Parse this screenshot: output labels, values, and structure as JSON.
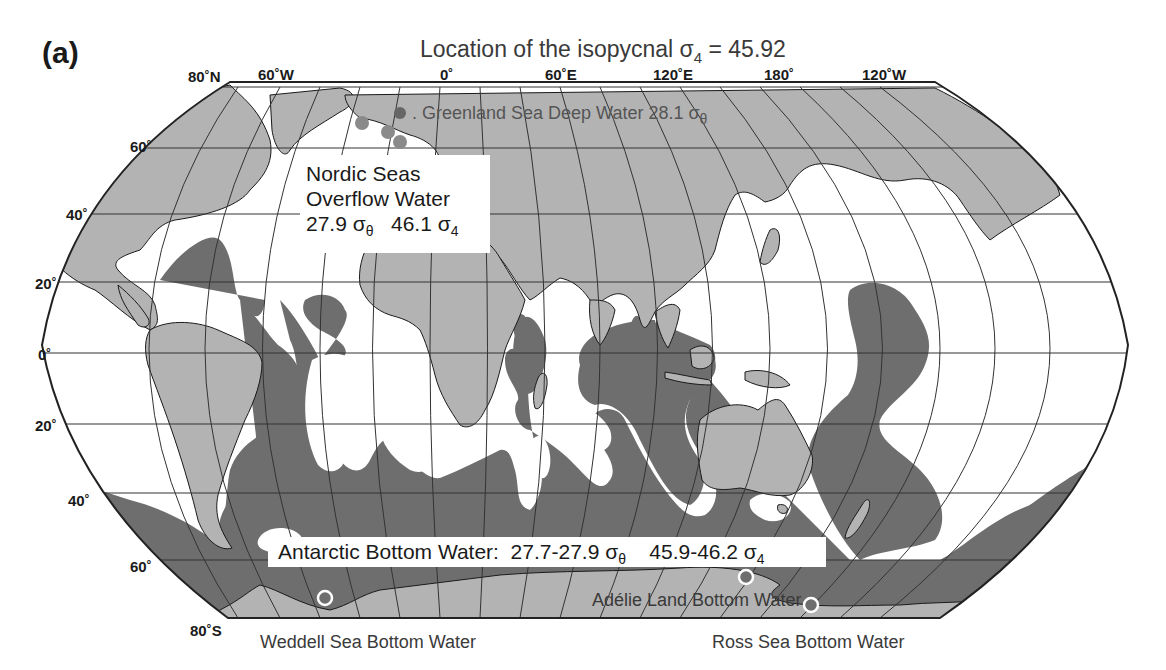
{
  "panel": {
    "label": "(a)"
  },
  "title": {
    "prefix": "Location of the isopycnal σ",
    "sub": "4",
    "suffix": " = 45.92"
  },
  "axes": {
    "longitude_labels": [
      {
        "text": "60˚W",
        "x": 275
      },
      {
        "text": "0˚",
        "x": 446
      },
      {
        "text": "60˚E",
        "x": 545
      },
      {
        "text": "120˚E",
        "x": 653
      },
      {
        "text": "180˚",
        "x": 764
      },
      {
        "text": "120˚W",
        "x": 862
      }
    ],
    "latitude_labels": [
      {
        "text": "80˚N",
        "x": 214,
        "y": 78
      },
      {
        "text": "60˚",
        "x": 130,
        "y": 138
      },
      {
        "text": "40˚",
        "x": 66,
        "y": 208
      },
      {
        "text": "20˚",
        "x": 35,
        "y": 277
      },
      {
        "text": "0˚",
        "x": 38,
        "y": 349
      },
      {
        "text": "20˚",
        "x": 35,
        "y": 420
      },
      {
        "text": "40˚",
        "x": 68,
        "y": 492
      },
      {
        "text": "60˚",
        "x": 130,
        "y": 563
      },
      {
        "text": "80˚S",
        "x": 214,
        "y": 622
      }
    ]
  },
  "annotations": {
    "greenland": {
      "text": ". Greenland Sea Deep Water 28.1 σ",
      "sub": "θ"
    },
    "nordic": {
      "line1": "Nordic Seas",
      "line2": "Overflow Water",
      "v1": "27.9 σ",
      "v1sub": "θ",
      "v2": "46.1 σ",
      "v2sub": "4"
    },
    "abw": {
      "label": "Antarctic Bottom Water:  27.7-27.9 σ",
      "sub1": "θ",
      "mid": "    45.9-46.2 σ",
      "sub2": "4"
    },
    "adelie": {
      "text": "Adélie Land Bottom Water"
    },
    "weddell": {
      "text": "Weddell Sea Bottom Water"
    },
    "ross": {
      "text": "Ross Sea Bottom Water"
    }
  },
  "colors": {
    "land": "#b3b3b3",
    "isopycnal_region": "#6e6e6e",
    "ocean": "#ffffff",
    "grid": "#333333",
    "source_marker": "#6e6e6e",
    "nordic_marker": "#8a8a8a"
  },
  "markers": {
    "nordic_sources": [
      {
        "x": 400,
        "y": 113
      },
      {
        "x": 362,
        "y": 123
      },
      {
        "x": 388,
        "y": 132
      },
      {
        "x": 400,
        "y": 142
      }
    ],
    "antarctic_sources": [
      {
        "name": "Weddell",
        "x": 325,
        "y": 598
      },
      {
        "name": "Adelie",
        "x": 746,
        "y": 577
      },
      {
        "name": "Ross",
        "x": 811,
        "y": 605
      }
    ]
  }
}
